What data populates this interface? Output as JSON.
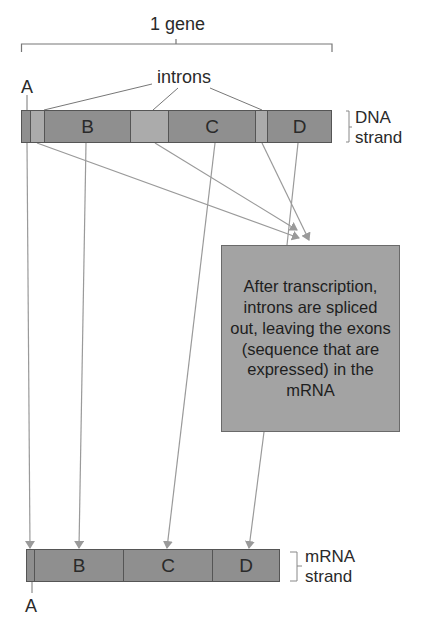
{
  "gene_label": "1 gene",
  "introns_label": "introns",
  "dna": {
    "label_line1": "DNA",
    "label_line2": "strand",
    "segments": [
      {
        "type": "exon",
        "label": "",
        "x": 21,
        "w": 10
      },
      {
        "type": "intron",
        "label": "",
        "x": 31,
        "w": 13
      },
      {
        "type": "exon",
        "label": "B",
        "x": 44,
        "w": 87
      },
      {
        "type": "intron",
        "label": "",
        "x": 131,
        "w": 37
      },
      {
        "type": "exon",
        "label": "C",
        "x": 168,
        "w": 88
      },
      {
        "type": "intron",
        "label": "",
        "x": 256,
        "w": 11
      },
      {
        "type": "exon",
        "label": "D",
        "x": 267,
        "w": 65
      }
    ],
    "exon_a_label": "A"
  },
  "mrna": {
    "label_line1": "mRNA",
    "label_line2": "strand",
    "segments": [
      {
        "label": "",
        "x": 26,
        "w": 9
      },
      {
        "label": "B",
        "x": 35,
        "w": 89
      },
      {
        "label": "C",
        "x": 124,
        "w": 89
      },
      {
        "label": "D",
        "x": 213,
        "w": 67
      }
    ],
    "exon_a_label": "A"
  },
  "note_text": "After transcription, introns are spliced out, leaving the exons (sequence that are expressed) in the mRNA",
  "colors": {
    "exon": "#8f8f8f",
    "intron": "#ababab",
    "note_bg": "#a3a3a3",
    "line": "#9a9a9a",
    "bracket": "#777777"
  }
}
